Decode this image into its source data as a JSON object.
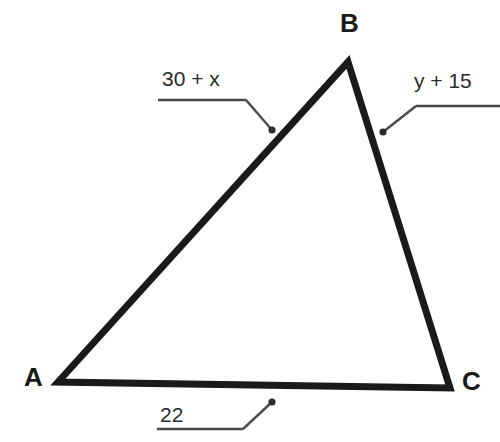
{
  "figure": {
    "type": "triangle-diagram",
    "background_color": "#ffffff",
    "stroke_color": "#1a1a1a",
    "leader_color": "#3a3a3a",
    "vertices": [
      {
        "name": "A",
        "label": "A",
        "x": 58,
        "y": 382
      },
      {
        "name": "B",
        "label": "B",
        "x": 348,
        "y": 62
      },
      {
        "name": "C",
        "label": "C",
        "x": 450,
        "y": 388
      }
    ],
    "sides": [
      {
        "name": "side-ab",
        "label": "30 + x",
        "from": "A",
        "to": "B",
        "leader": {
          "underline_x1": 158,
          "underline_x2": 246,
          "underline_y": 100,
          "elbow_x": 246,
          "elbow_y": 100,
          "dot_x": 272,
          "dot_y": 130
        }
      },
      {
        "name": "side-bc",
        "label": "y + 15",
        "from": "B",
        "to": "C",
        "leader": {
          "underline_x1": 416,
          "underline_x2": 500,
          "underline_y": 106,
          "elbow_x": 416,
          "elbow_y": 106,
          "dot_x": 383,
          "dot_y": 132
        }
      },
      {
        "name": "side-ac",
        "label": "22",
        "from": "A",
        "to": "C",
        "leader": {
          "underline_x1": 157,
          "underline_x2": 243,
          "underline_y": 429,
          "elbow_x": 243,
          "elbow_y": 429,
          "dot_x": 272,
          "dot_y": 402
        }
      }
    ]
  }
}
